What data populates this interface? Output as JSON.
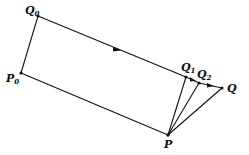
{
  "diagram": {
    "type": "geometric-construction",
    "points": {
      "Q0": {
        "label": "Q",
        "sub": "0",
        "x": 38,
        "y": 16
      },
      "P0": {
        "label": "P",
        "sub": "0",
        "x": 21,
        "y": 73
      },
      "P": {
        "label": "P",
        "sub": "",
        "x": 168,
        "y": 135
      },
      "Q1": {
        "label": "Q",
        "sub": "1",
        "x": 186,
        "y": 77
      },
      "Q2": {
        "label": "Q",
        "sub": "2",
        "x": 199,
        "y": 83
      },
      "Q": {
        "label": "Q",
        "sub": "",
        "x": 222,
        "y": 88
      }
    },
    "edges": [
      [
        "P0",
        "Q0"
      ],
      [
        "Q0",
        "Q1"
      ],
      [
        "Q1",
        "Q2"
      ],
      [
        "Q2",
        "Q"
      ],
      [
        "P0",
        "P"
      ],
      [
        "P",
        "Q1"
      ],
      [
        "P",
        "Q2"
      ],
      [
        "P",
        "Q"
      ]
    ],
    "arrows_on": [
      "Q0-Q1",
      "Q1-Q2",
      "Q2-Q"
    ],
    "labels": {
      "Q0": {
        "main": "Q",
        "sub": "0"
      },
      "P0": {
        "main": "P",
        "sub": "0"
      },
      "Q1": {
        "main": "Q",
        "sub": "1"
      },
      "Q2": {
        "main": "Q",
        "sub": "2"
      },
      "Q": {
        "main": "Q"
      },
      "P": {
        "main": "P"
      }
    },
    "line_color": "#111111"
  }
}
